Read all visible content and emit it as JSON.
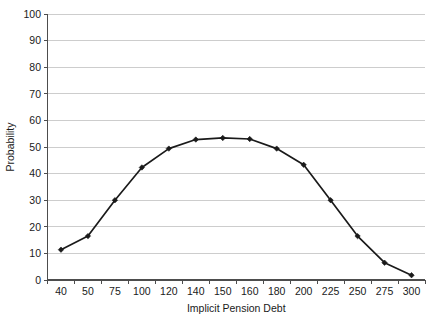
{
  "chart_data": {
    "type": "line",
    "title": "",
    "xlabel": "Implicit Pension Debt",
    "ylabel": "Probability",
    "categories": [
      "40",
      "50",
      "75",
      "100",
      "120",
      "140",
      "150",
      "160",
      "180",
      "200",
      "225",
      "250",
      "275",
      "300"
    ],
    "values": [
      11.4,
      16.5,
      30.0,
      42.3,
      49.4,
      52.8,
      53.4,
      53.0,
      49.4,
      43.3,
      30.0,
      16.5,
      6.5,
      1.8
    ],
    "series": [
      {
        "name": "Probability",
        "values": [
          11.4,
          16.5,
          30.0,
          42.3,
          49.4,
          52.8,
          53.4,
          53.0,
          49.4,
          43.3,
          30.0,
          16.5,
          6.5,
          1.8
        ]
      }
    ],
    "ylim": [
      0,
      100
    ],
    "yticks": [
      "0",
      "10",
      "20",
      "30",
      "40",
      "50",
      "60",
      "70",
      "80",
      "90",
      "100"
    ],
    "ytick_values": [
      0,
      10,
      20,
      30,
      40,
      50,
      60,
      70,
      80,
      90,
      100
    ],
    "xtick_labels": [
      "40",
      "50",
      "75",
      "100",
      "120",
      "140",
      "150",
      "160",
      "180",
      "200",
      "225",
      "250",
      "275",
      "300"
    ],
    "grid": "horizontal",
    "legend": "none",
    "marker": "diamond",
    "line_color": "#1a1a1a",
    "grid_color": "#c8c8c8",
    "axis_color": "#4d4d4d",
    "background_color": "#ffffff"
  }
}
